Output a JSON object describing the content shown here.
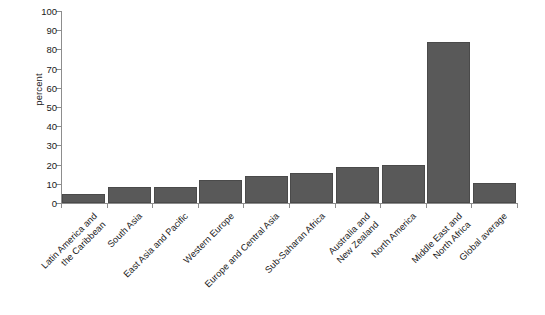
{
  "chart_data": {
    "type": "bar",
    "title": "",
    "subtitle": "",
    "xlabel": "",
    "ylabel": "percent",
    "ylim": [
      0,
      100
    ],
    "y_ticks": [
      0,
      10,
      20,
      30,
      40,
      50,
      60,
      70,
      80,
      90,
      100
    ],
    "grid": false,
    "legend": null,
    "bar_color": "#595959",
    "bar_border_color": "#4a4a4a",
    "axis_color": "#8d8d8d",
    "categories": [
      "Latin America and the Caribbean",
      "South Asia",
      "East Asia and Pacific",
      "Western Europe",
      "Europe and Central Asia",
      "Sub-Saharan Africa",
      "Australia and New Zealand",
      "North America",
      "Middle East and North Africa",
      "Global average"
    ],
    "category_lines": [
      [
        "Latin America and",
        "the Caribbean"
      ],
      [
        "South Asia"
      ],
      [
        "East Asia and Pacific"
      ],
      [
        "Western Europe"
      ],
      [
        "Europe and Central Asia"
      ],
      [
        "Sub-Saharan Africa"
      ],
      [
        "Australia and",
        "New Zealand"
      ],
      [
        "North America"
      ],
      [
        "Middle East and",
        "North Africa"
      ],
      [
        "Global average"
      ]
    ],
    "values": [
      4.5,
      8.5,
      8.5,
      12,
      14,
      15.5,
      18.5,
      20,
      84,
      10.5
    ]
  }
}
